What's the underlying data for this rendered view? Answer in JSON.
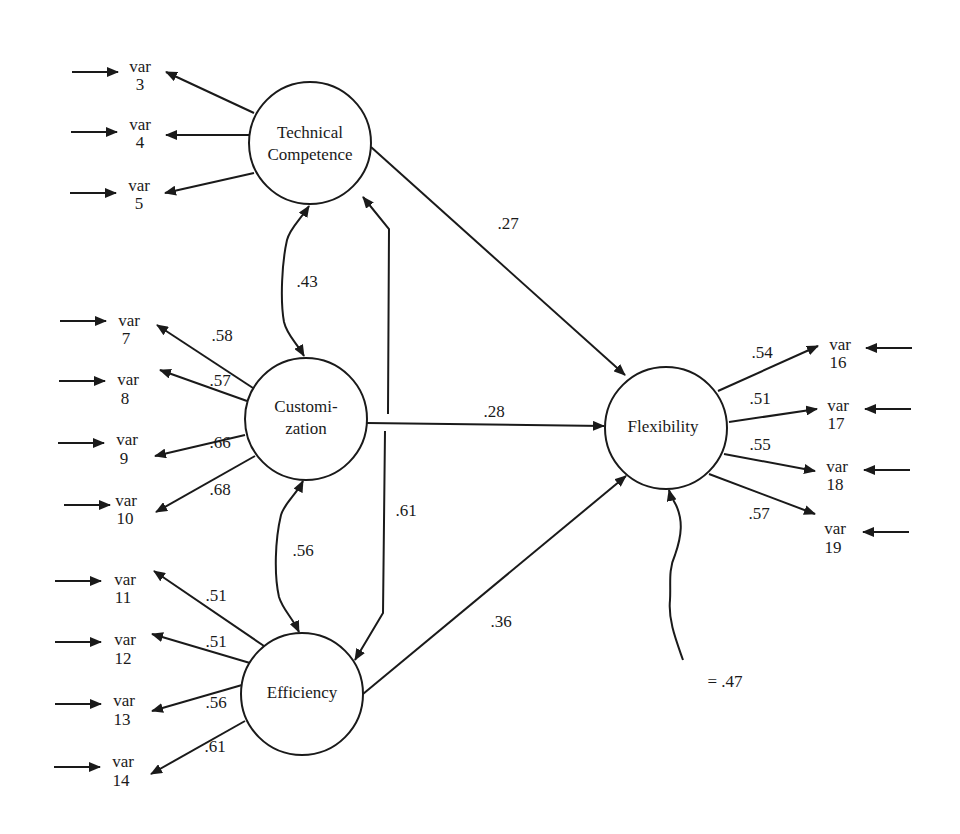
{
  "diagram": {
    "type": "structural-equation-model",
    "colors": {
      "ink": "#1a1a1a",
      "background": "#ffffff"
    },
    "latent_factors": [
      {
        "id": "tc",
        "label_lines": [
          "Technical",
          "Competence"
        ],
        "cx": 310,
        "cy": 143,
        "r": 61
      },
      {
        "id": "cu",
        "label_lines": [
          "Customi-",
          "zation"
        ],
        "cx": 306,
        "cy": 419,
        "r": 61
      },
      {
        "id": "ef",
        "label_lines": [
          "Efficiency"
        ],
        "cx": 302,
        "cy": 694,
        "r": 61
      },
      {
        "id": "fl",
        "label_lines": [
          "Flexibility"
        ],
        "cx": 666,
        "cy": 428,
        "r": 61
      }
    ],
    "indicators": {
      "tc": [
        {
          "var": "var",
          "num": "3",
          "x": 140,
          "y": 72,
          "loading": ""
        },
        {
          "var": "var",
          "num": "4",
          "x": 140,
          "y": 130,
          "loading": ""
        },
        {
          "var": "var",
          "num": "5",
          "x": 140,
          "y": 191,
          "loading": ""
        }
      ],
      "cu": [
        {
          "var": "var",
          "num": "7",
          "x": 129,
          "y": 326,
          "loading": ".58"
        },
        {
          "var": "var",
          "num": "8",
          "x": 129,
          "y": 385,
          "loading": ".57"
        },
        {
          "var": "var",
          "num": "9",
          "x": 129,
          "y": 445,
          "loading": ".66"
        },
        {
          "var": "var",
          "num": "10",
          "x": 129,
          "y": 505,
          "loading": ".68"
        }
      ],
      "ef": [
        {
          "var": "var",
          "num": "11",
          "x": 125,
          "y": 584,
          "loading": ".51"
        },
        {
          "var": "var",
          "num": "12",
          "x": 125,
          "y": 644,
          "loading": ".51"
        },
        {
          "var": "var",
          "num": "13",
          "x": 125,
          "y": 705,
          "loading": ".56"
        },
        {
          "var": "var",
          "num": "14",
          "x": 125,
          "y": 766,
          "loading": ".61"
        }
      ],
      "fl": [
        {
          "var": "var",
          "num": "16",
          "x": 839,
          "y": 356,
          "loading": ".54"
        },
        {
          "var": "var",
          "num": "17",
          "x": 837,
          "y": 416,
          "loading": ".51"
        },
        {
          "var": "var",
          "num": "18",
          "x": 837,
          "y": 477,
          "loading": ".55"
        },
        {
          "var": "var",
          "num": "19",
          "x": 835,
          "y": 539,
          "loading": ".57"
        }
      ]
    },
    "structural_paths": [
      {
        "from": "tc",
        "to": "fl",
        "coefficient": ".27"
      },
      {
        "from": "cu",
        "to": "fl",
        "coefficient": ".28"
      },
      {
        "from": "ef",
        "to": "fl",
        "coefficient": ".36"
      }
    ],
    "covariances": [
      {
        "between": [
          "tc",
          "cu"
        ],
        "value": ".43"
      },
      {
        "between": [
          "cu",
          "ef"
        ],
        "value": ".56"
      },
      {
        "between": [
          "tc",
          "ef"
        ],
        "value": ".61"
      }
    ],
    "disturbance": {
      "target": "fl",
      "label": "= .47"
    }
  }
}
